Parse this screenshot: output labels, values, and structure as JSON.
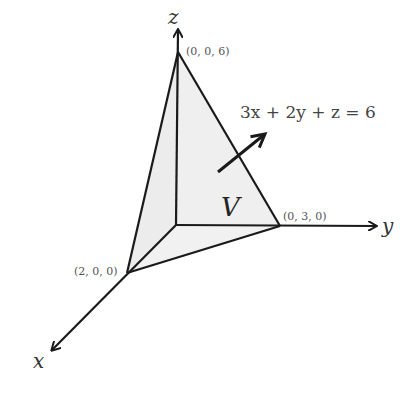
{
  "diagram": {
    "axes": {
      "x_label": "x",
      "y_label": "y",
      "z_label": "z"
    },
    "vertices": {
      "z_intercept": "(0, 0, 6)",
      "y_intercept": "(0, 3, 0)",
      "x_intercept": "(2, 0, 0)"
    },
    "plane_equation": "3x + 2y + z = 6",
    "region_label": "V",
    "colors": {
      "stroke": "#1a1a1a",
      "fill": "#eeeeee",
      "background": "#ffffff"
    }
  }
}
